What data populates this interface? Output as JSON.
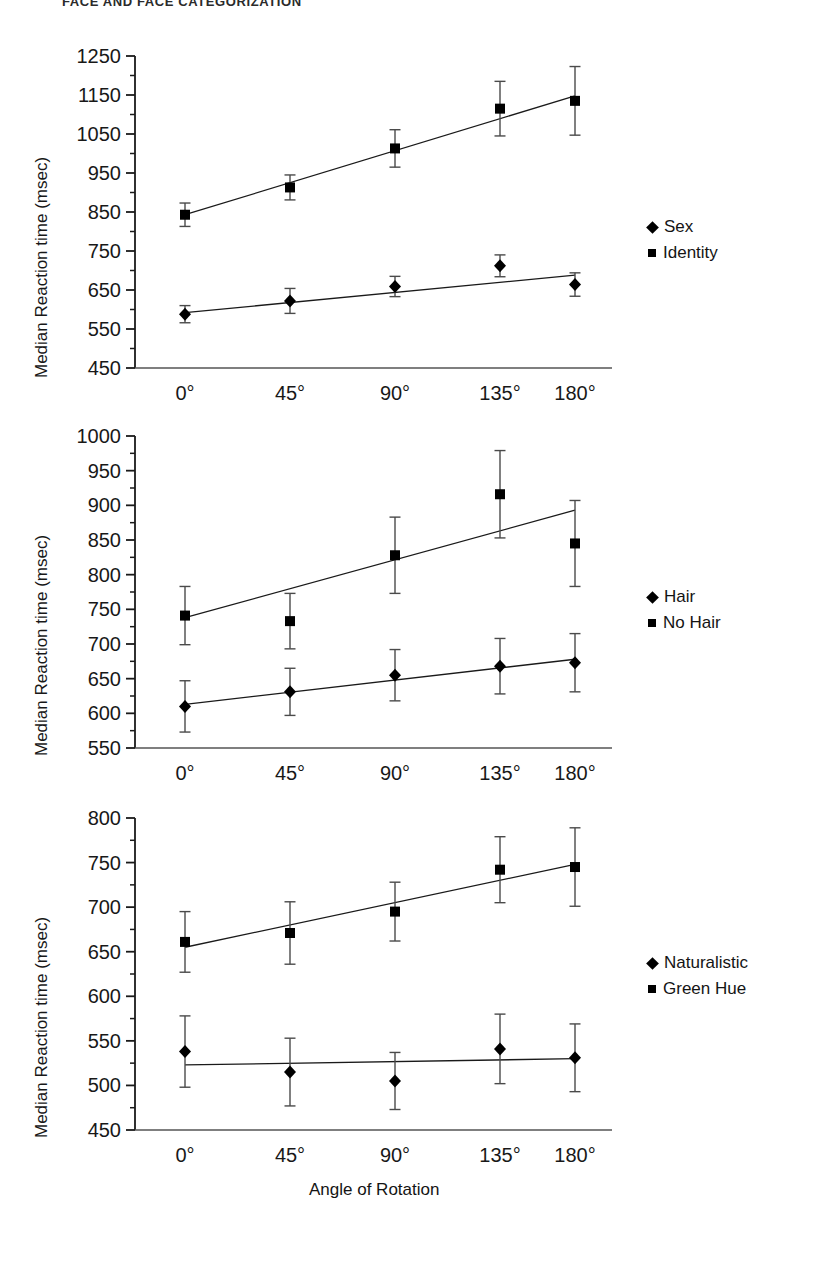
{
  "header": {
    "running_head": "FACE AND FACE CATEGORIZATION"
  },
  "axis": {
    "ylabel": "Median Reaction time (msec)",
    "xlabel": "Angle of Rotation",
    "xticklabels": [
      "0°",
      "45°",
      "90°",
      "135°",
      "180°"
    ]
  },
  "legend_markers": {
    "diamond": "diamond-marker",
    "square": "square-marker"
  },
  "chart_data": [
    {
      "type": "line",
      "panel": 1,
      "title": "",
      "xlabel": "",
      "ylabel": "Median Reaction time (msec)",
      "x": [
        0,
        45,
        90,
        135,
        180
      ],
      "xticklabels": [
        "0°",
        "45°",
        "90°",
        "135°",
        "180°"
      ],
      "yticklabels": [
        "450",
        "550",
        "650",
        "750",
        "850",
        "950",
        "1050",
        "1150",
        "1250"
      ],
      "yticks": [
        450,
        550,
        650,
        750,
        850,
        950,
        1050,
        1150,
        1250
      ],
      "ylim": [
        450,
        1250
      ],
      "grid": false,
      "legend_position": "right",
      "series": [
        {
          "name": "Sex",
          "marker": "diamond",
          "values": [
            588,
            622,
            659,
            712,
            664
          ],
          "errors": [
            22,
            32,
            26,
            28,
            30
          ],
          "fit_line": {
            "y_start": 592,
            "y_end": 688
          }
        },
        {
          "name": "Identity",
          "marker": "square",
          "values": [
            843,
            913,
            1013,
            1115,
            1135
          ],
          "errors": [
            30,
            32,
            48,
            70,
            88
          ],
          "fit_line": {
            "y_start": 843,
            "y_end": 1148
          }
        }
      ]
    },
    {
      "type": "line",
      "panel": 2,
      "title": "",
      "xlabel": "",
      "ylabel": "Median Reaction time (msec)",
      "x": [
        0,
        45,
        90,
        135,
        180
      ],
      "xticklabels": [
        "0°",
        "45°",
        "90°",
        "135°",
        "180°"
      ],
      "yticklabels": [
        "550",
        "600",
        "650",
        "700",
        "750",
        "800",
        "850",
        "900",
        "950",
        "1000"
      ],
      "yticks": [
        550,
        600,
        650,
        700,
        750,
        800,
        850,
        900,
        950,
        1000
      ],
      "ylim": [
        550,
        1000
      ],
      "grid": false,
      "legend_position": "right",
      "series": [
        {
          "name": "Hair",
          "marker": "diamond",
          "values": [
            610,
            631,
            655,
            668,
            673
          ],
          "errors": [
            37,
            34,
            37,
            40,
            42
          ],
          "fit_line": {
            "y_start": 613,
            "y_end": 678
          }
        },
        {
          "name": "No Hair",
          "marker": "square",
          "values": [
            741,
            733,
            828,
            916,
            845
          ],
          "errors": [
            42,
            40,
            55,
            63,
            62
          ],
          "fit_line": {
            "y_start": 738,
            "y_end": 893
          }
        }
      ]
    },
    {
      "type": "line",
      "panel": 3,
      "title": "",
      "xlabel": "Angle of Rotation",
      "ylabel": "Median Reaction time (msec)",
      "x": [
        0,
        45,
        90,
        135,
        180
      ],
      "xticklabels": [
        "0°",
        "45°",
        "90°",
        "135°",
        "180°"
      ],
      "yticklabels": [
        "450",
        "500",
        "550",
        "600",
        "650",
        "700",
        "750",
        "800"
      ],
      "yticks": [
        450,
        500,
        550,
        600,
        650,
        700,
        750,
        800
      ],
      "ylim": [
        450,
        800
      ],
      "grid": false,
      "legend_position": "right",
      "series": [
        {
          "name": "Naturalistic",
          "marker": "diamond",
          "values": [
            538,
            515,
            505,
            541,
            531
          ],
          "errors": [
            40,
            38,
            32,
            39,
            38
          ],
          "fit_line": {
            "y_start": 523,
            "y_end": 530
          }
        },
        {
          "name": "Green Hue",
          "marker": "square",
          "values": [
            661,
            671,
            695,
            742,
            745
          ],
          "errors": [
            34,
            35,
            33,
            37,
            44
          ],
          "fit_line": {
            "y_start": 655,
            "y_end": 748
          }
        }
      ]
    }
  ]
}
